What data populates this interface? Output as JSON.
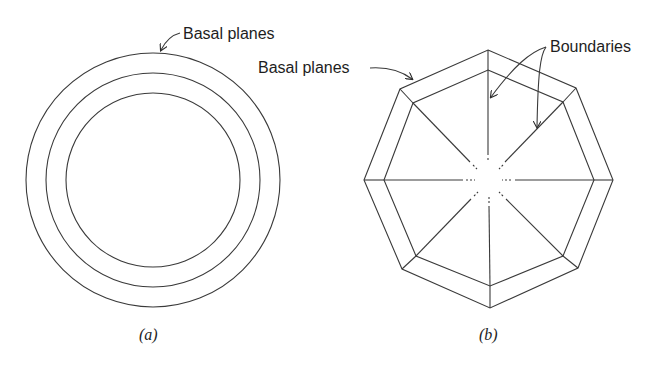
{
  "figure_a": {
    "caption": "(a)",
    "label": "Basal planes",
    "circles": {
      "cx": 153,
      "cy": 180,
      "radii": [
        127,
        107,
        87
      ]
    }
  },
  "figure_b": {
    "caption": "(b)",
    "label_basal": "Basal planes",
    "label_boundaries": "Boundaries",
    "outer_octagon": "488,50 576,88 613,180 578,268 490,308 402,269 364,180 400,89",
    "inner_octagon": "488,70 563,102 594,180 563,256 490,286 416,256 384,180 413,103"
  },
  "colors": {
    "line": "#3a3a3a",
    "text": "#1e1e1e",
    "background": "#ffffff"
  }
}
